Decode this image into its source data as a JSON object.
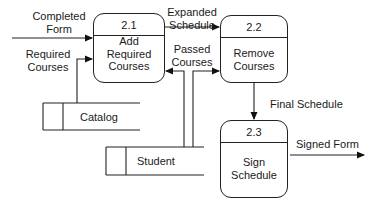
{
  "diagram": {
    "type": "data-flow-diagram",
    "processes": [
      {
        "id": "2.1",
        "name_line1": "Add",
        "name_line2": "Required",
        "name_line3": "Courses"
      },
      {
        "id": "2.2",
        "name_line1": "Remove",
        "name_line2": "Courses"
      },
      {
        "id": "2.3",
        "name_line1": "Sign",
        "name_line2": "Schedule"
      }
    ],
    "data_stores": [
      {
        "name": "Catalog"
      },
      {
        "name": "Student"
      }
    ],
    "flows": [
      {
        "line1": "Completed",
        "line2": "Form",
        "from": "external",
        "to": "2.1"
      },
      {
        "line1": "Required",
        "line2": "Courses",
        "from": "Catalog",
        "to": "2.1"
      },
      {
        "line1": "Expanded",
        "line2": "Schedule",
        "from": "2.1",
        "to": "2.2"
      },
      {
        "line1": "Passed",
        "line2": "Courses",
        "from": "Student",
        "to": "2.1, 2.2"
      },
      {
        "line1": "Final Schedule",
        "from": "2.2",
        "to": "2.3"
      },
      {
        "line1": "Signed Form",
        "from": "2.3",
        "to": "external"
      }
    ]
  }
}
